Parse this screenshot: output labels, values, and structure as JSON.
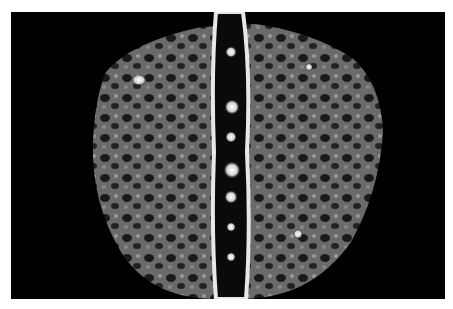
{
  "image": {
    "description": "Grayscale processed medical scan of a human back showing the spine as a bright vertical band with surrounding mottled tissue texture",
    "background_color": "#000000",
    "border_color": "#ffffff"
  }
}
